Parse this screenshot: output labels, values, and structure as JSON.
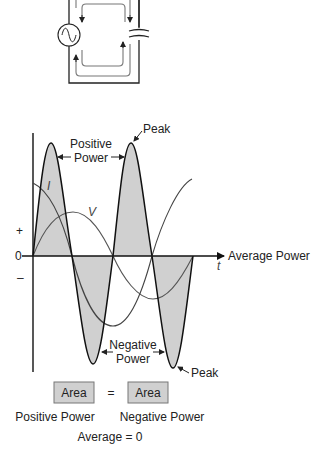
{
  "circuit": {
    "source_icon": "ac-source-icon",
    "capacitor_icon": "capacitor-icon"
  },
  "graph": {
    "labels": {
      "positive_power_line1": "Positive",
      "positive_power_line2": "Power",
      "peak_top": "Peak",
      "peak_bottom": "Peak",
      "negative_power_line1": "Negative",
      "negative_power_line2": "Power",
      "current": "I",
      "voltage": "V",
      "plus": "+",
      "zero": "0",
      "minus": "–",
      "average_power": "Average Power",
      "time_axis": "t"
    },
    "colors": {
      "fill": "#d0d0d0",
      "power_line": "#111111",
      "vi_line": "#555555",
      "axis": "#111111"
    }
  },
  "equation": {
    "left_box": "Area",
    "equals": "=",
    "right_box": "Area",
    "left_caption": "Positive Power",
    "right_caption": "Negative Power",
    "result": "Average = 0"
  }
}
